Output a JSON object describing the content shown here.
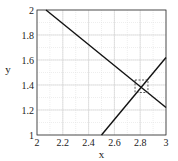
{
  "chart_data": {
    "type": "line",
    "title": "",
    "xlabel": "x",
    "ylabel": "y",
    "xlim": [
      2,
      3
    ],
    "ylim": [
      1,
      2
    ],
    "xticks": [
      "2",
      "2.2",
      "2.4",
      "2.6",
      "2.8",
      "3"
    ],
    "yticks": [
      "1",
      "1.2",
      "1.4",
      "1.6",
      "1.8",
      "2"
    ],
    "grid": true,
    "legend": null,
    "series": [
      {
        "name": "line-1",
        "x": [
          2.07,
          3.0
        ],
        "y": [
          2.0,
          1.22
        ]
      },
      {
        "name": "line-2",
        "x": [
          2.5,
          3.0
        ],
        "y": [
          1.0,
          1.62
        ]
      }
    ],
    "annotations": [
      {
        "type": "dashed-box",
        "x": [
          2.76,
          2.86
        ],
        "y": [
          1.34,
          1.44
        ],
        "note": "intersection near (2.81, 1.38)"
      }
    ]
  },
  "axes": {
    "xlabel": "x",
    "ylabel": "y",
    "xticks": [
      "2",
      "2.2",
      "2.4",
      "2.6",
      "2.8",
      "3"
    ],
    "yticks": [
      "1",
      "1.2",
      "1.4",
      "1.6",
      "1.8",
      "2"
    ]
  }
}
